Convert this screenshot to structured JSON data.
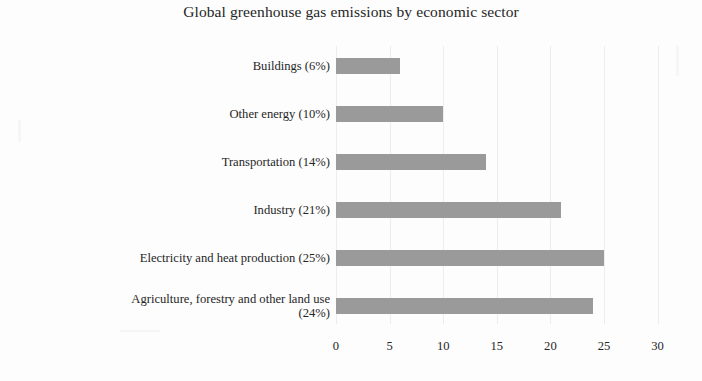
{
  "chart_data": {
    "type": "bar",
    "orientation": "horizontal",
    "title": "Global greenhouse gas emissions  by economic sector",
    "xlabel": "",
    "ylabel": "",
    "xlim": [
      0,
      30
    ],
    "xticks": [
      0,
      5,
      10,
      15,
      20,
      25,
      30
    ],
    "xtick_labels": [
      "0",
      "5",
      "10",
      "15",
      "20",
      "25",
      "30"
    ],
    "grid": true,
    "legend": null,
    "bar_color": "#9a9a9a",
    "categories": [
      "Buildings (6%)",
      "Other energy (10%)",
      "Transportation (14%)",
      "Industry (21%)",
      "Electricity and heat production (25%)",
      "Agriculture, forestry and other land use\n(24%)"
    ],
    "values": [
      6,
      10,
      14,
      21,
      25,
      24
    ],
    "bars": [
      {
        "label": "Buildings (6%)",
        "value": 6
      },
      {
        "label": "Other energy (10%)",
        "value": 10
      },
      {
        "label": "Transportation (14%)",
        "value": 14
      },
      {
        "label": "Industry (21%)",
        "value": 21
      },
      {
        "label": "Electricity and heat production (25%)",
        "value": 25
      },
      {
        "label": "Agriculture, forestry and other land use\n(24%)",
        "value": 24
      }
    ]
  }
}
